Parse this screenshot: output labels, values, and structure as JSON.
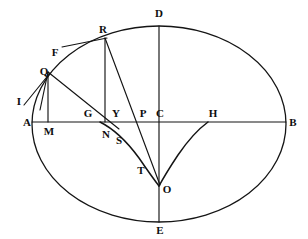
{
  "figure": {
    "width": 308,
    "height": 239,
    "stroke_color": "#141414",
    "background_color": "#ffffff"
  },
  "ellipse": {
    "center": {
      "x": 159,
      "y": 122
    },
    "semi_major_x": 127,
    "semi_minor_y": 106,
    "left_vertex": {
      "x": 32,
      "y": 122
    },
    "right_vertex": {
      "x": 286,
      "y": 122
    },
    "top_vertex": {
      "x": 159,
      "y": 26
    },
    "bottom_vertex": {
      "x": 159,
      "y": 222
    }
  },
  "labels": [
    {
      "id": "A",
      "text": "A",
      "x": 27,
      "y": 122
    },
    {
      "id": "B",
      "text": "B",
      "x": 293,
      "y": 122
    },
    {
      "id": "C",
      "text": "C",
      "x": 160,
      "y": 113
    },
    {
      "id": "D",
      "text": "D",
      "x": 159,
      "y": 13
    },
    {
      "id": "E",
      "text": "E",
      "x": 160,
      "y": 230
    },
    {
      "id": "F",
      "text": "F",
      "x": 55,
      "y": 52
    },
    {
      "id": "G",
      "text": "G",
      "x": 88,
      "y": 113
    },
    {
      "id": "H",
      "text": "H",
      "x": 213,
      "y": 113
    },
    {
      "id": "I",
      "text": "I",
      "x": 19,
      "y": 101
    },
    {
      "id": "M",
      "text": "M",
      "x": 49,
      "y": 131
    },
    {
      "id": "N",
      "text": "N",
      "x": 106,
      "y": 134
    },
    {
      "id": "O",
      "text": "O",
      "x": 167,
      "y": 189
    },
    {
      "id": "P",
      "text": "P",
      "x": 143,
      "y": 113
    },
    {
      "id": "Q",
      "text": "Q",
      "x": 44,
      "y": 71
    },
    {
      "id": "R",
      "text": "R",
      "x": 103,
      "y": 29
    },
    {
      "id": "S",
      "text": "S",
      "x": 119,
      "y": 140
    },
    {
      "id": "T",
      "text": "T",
      "x": 141,
      "y": 170
    },
    {
      "id": "Y",
      "text": "Y",
      "x": 116,
      "y": 113
    }
  ],
  "segments": [
    {
      "name": "major-axis-AB",
      "x1": 32,
      "y1": 122,
      "x2": 286,
      "y2": 122
    },
    {
      "name": "minor-axis-DE",
      "x1": 159,
      "y1": 26,
      "x2": 159,
      "y2": 222
    },
    {
      "name": "ordinate-QM",
      "x1": 48,
      "y1": 72,
      "x2": 48,
      "y2": 122
    },
    {
      "name": "ordinate-RN",
      "x1": 105,
      "y1": 38,
      "x2": 105,
      "y2": 122
    },
    {
      "name": "chord-QN",
      "x1": 48,
      "y1": 72,
      "x2": 119,
      "y2": 129
    },
    {
      "name": "tangent-FR",
      "x1": 62,
      "y1": 47,
      "x2": 107,
      "y2": 38
    },
    {
      "name": "normal-IQ",
      "x1": 24,
      "y1": 105,
      "x2": 50,
      "y2": 73
    },
    {
      "name": "normal-Q-lower",
      "x1": 48,
      "y1": 72,
      "x2": 40,
      "y2": 110
    },
    {
      "name": "normal-RO",
      "x1": 105,
      "y1": 38,
      "x2": 160,
      "y2": 185
    }
  ],
  "curves": [
    {
      "name": "evolute-left-branch",
      "path": "M 100 122 Q 120 132 139 158 Q 152 177 159 186",
      "from_label": "Y",
      "to_label": "O"
    },
    {
      "name": "evolute-right-branch",
      "path": "M 208 122 Q 193 133 178 155 Q 166 173 159 186",
      "from_label": "H",
      "to_label": "O"
    }
  ],
  "notes": {
    "cusp_point": "O",
    "ellipse_type": "ellipse with evolute (astroid-like) branches meeting at cusp O"
  }
}
